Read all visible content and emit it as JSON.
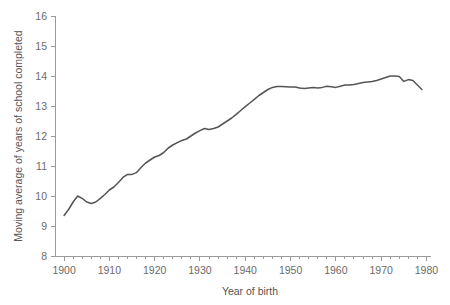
{
  "chart_data": {
    "type": "line",
    "title": "",
    "xlabel": "Year of birth",
    "ylabel": "Moving average of years of school completed",
    "xlim": [
      1898,
      1981
    ],
    "ylim": [
      8,
      16
    ],
    "grid": false,
    "legend": "none",
    "x_major_ticks": [
      1900,
      1910,
      1920,
      1930,
      1940,
      1950,
      1960,
      1970,
      1980
    ],
    "x_major_tick_labels": [
      "1900",
      "1910",
      "1920",
      "1930",
      "1940",
      "1950",
      "1960",
      "1970",
      "1980"
    ],
    "x_minor_tick_interval": 2,
    "y_major_ticks": [
      8,
      9,
      10,
      11,
      12,
      13,
      14,
      15,
      16
    ],
    "y_major_tick_labels": [
      "8",
      "9",
      "10",
      "11",
      "12",
      "13",
      "14",
      "15",
      "16"
    ],
    "line_color": "#555555",
    "axis_color": "#9a9a9a",
    "tick_label_color": "#6b6b6b",
    "axis_title_color": "#555555",
    "background_color": "#ffffff",
    "series": [
      {
        "name": "Moving average of years of school completed",
        "x": [
          1900,
          1901,
          1902,
          1903,
          1904,
          1905,
          1906,
          1907,
          1908,
          1909,
          1910,
          1911,
          1912,
          1913,
          1914,
          1915,
          1916,
          1917,
          1918,
          1919,
          1920,
          1921,
          1922,
          1923,
          1924,
          1925,
          1926,
          1927,
          1928,
          1929,
          1930,
          1931,
          1932,
          1933,
          1934,
          1935,
          1936,
          1937,
          1938,
          1939,
          1940,
          1941,
          1942,
          1943,
          1944,
          1945,
          1946,
          1947,
          1948,
          1949,
          1950,
          1951,
          1952,
          1953,
          1954,
          1955,
          1956,
          1957,
          1958,
          1959,
          1960,
          1961,
          1962,
          1963,
          1964,
          1965,
          1966,
          1967,
          1968,
          1969,
          1970,
          1971,
          1972,
          1973,
          1974,
          1975,
          1976,
          1977,
          1978,
          1979
        ],
        "values": [
          9.35,
          9.55,
          9.8,
          10.0,
          9.92,
          9.8,
          9.75,
          9.8,
          9.92,
          10.05,
          10.2,
          10.3,
          10.45,
          10.62,
          10.72,
          10.72,
          10.78,
          10.95,
          11.1,
          11.2,
          11.3,
          11.35,
          11.45,
          11.6,
          11.7,
          11.78,
          11.85,
          11.9,
          12.0,
          12.1,
          12.18,
          12.25,
          12.22,
          12.25,
          12.3,
          12.4,
          12.5,
          12.6,
          12.72,
          12.85,
          12.98,
          13.1,
          13.22,
          13.35,
          13.45,
          13.55,
          13.62,
          13.65,
          13.65,
          13.64,
          13.63,
          13.63,
          13.6,
          13.58,
          13.6,
          13.62,
          13.6,
          13.62,
          13.66,
          13.64,
          13.62,
          13.66,
          13.7,
          13.7,
          13.72,
          13.75,
          13.78,
          13.8,
          13.82,
          13.85,
          13.9,
          13.95,
          14.0,
          14.0,
          13.98,
          13.82,
          13.88,
          13.85,
          13.7,
          13.55
        ]
      }
    ]
  }
}
